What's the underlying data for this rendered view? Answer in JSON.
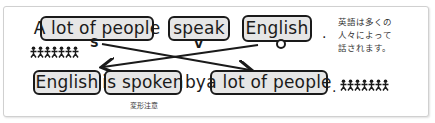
{
  "active_sentence": {
    "subject": "A lot of people",
    "verb": "speak",
    "object": "English",
    "period": ".",
    "subject_label": "S",
    "verb_label": "V",
    "object_label": "O"
  },
  "passive_sentence": {
    "subject": "English",
    "verb": "is spoken",
    "by": "by",
    "agent": "a lot of people",
    "period": ".",
    "verb_note": "変形注意"
  },
  "translation_note": "英語は多くの\n人々によって\n話されます。",
  "people_icons": "🯅🯅🯅🯅🯅🯅🯅",
  "colors": {
    "box_fill": "#e6e6e6",
    "border": "#1a1a1a",
    "frame_border": "#d0d0d0"
  }
}
